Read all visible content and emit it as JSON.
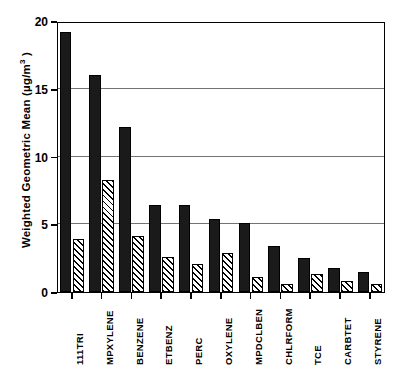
{
  "chart_data": {
    "type": "bar",
    "title": "",
    "xlabel": "",
    "ylabel": "Weighted Geometric Mean (µg/m3)",
    "ylabel_parts": {
      "text_before": "Weighted Geometric Mean (µg/m",
      "superscript": "3",
      "text_after": " )"
    },
    "ylim": [
      0,
      20
    ],
    "yticks": [
      0,
      5,
      10,
      15,
      20
    ],
    "ytick_labels": [
      "0",
      "5",
      "10",
      "15",
      "20"
    ],
    "grid": "horizontal",
    "legend_position": "none",
    "categories": [
      "111TRI",
      "MPXYLENE",
      "BENZENE",
      "ETBENZ",
      "PERC",
      "OXYLENE",
      "MPDCLBEN",
      "CHLRFORM",
      "TCE",
      "CARBTET",
      "STYRENE"
    ],
    "series": [
      {
        "name": "solid-black-series",
        "fill": "solid-black",
        "values": [
          19.2,
          16.0,
          12.2,
          6.4,
          6.4,
          5.4,
          5.1,
          3.4,
          2.5,
          1.8,
          1.5
        ]
      },
      {
        "name": "hatched-series",
        "fill": "diagonal-hatch",
        "values": [
          3.9,
          8.3,
          4.1,
          2.6,
          2.1,
          2.9,
          1.1,
          0.6,
          1.3,
          0.8,
          0.6
        ]
      }
    ]
  },
  "colors": {
    "solid_bar": "#1a1a1a",
    "hatch_line": "#000000",
    "background": "#ffffff",
    "axis": "#000000"
  }
}
